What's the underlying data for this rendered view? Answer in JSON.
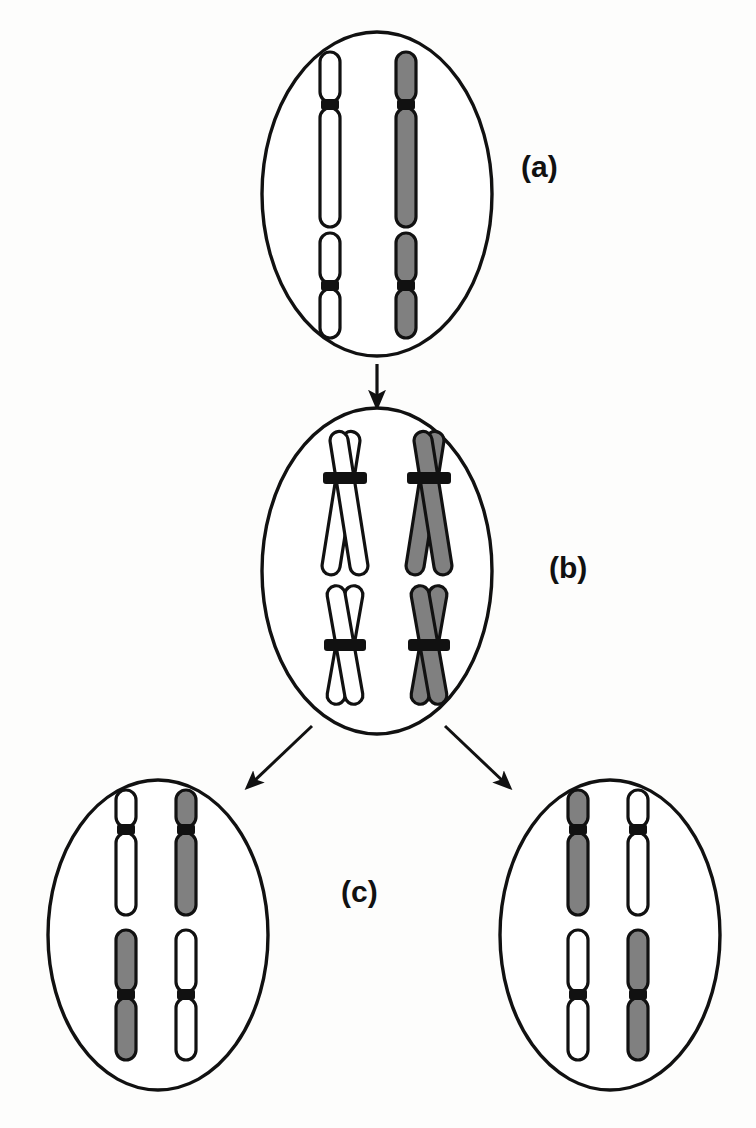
{
  "figure": {
    "background_color": "#fdfdfc",
    "stroke_color": "#111111",
    "chromosome_fill_white": "#ffffff",
    "chromosome_fill_gray": "#808080",
    "centromere_color": "#111111"
  },
  "labels": {
    "a": "(a)",
    "b": "(b)",
    "c": "(c)"
  },
  "cells": {
    "parent": {
      "name": "parent-cell",
      "label": "(a)",
      "cx": 377,
      "cy": 194,
      "rx": 115,
      "ry": 162,
      "state": "unreplicated",
      "chromosomes": [
        {
          "id": "a-long-white",
          "type": "acrocentric",
          "color": "white",
          "x": 330,
          "top": 52,
          "bottom": 227,
          "centromere_frac": 0.3
        },
        {
          "id": "a-long-gray",
          "type": "acrocentric",
          "color": "gray",
          "x": 406,
          "top": 52,
          "bottom": 227,
          "centromere_frac": 0.3
        },
        {
          "id": "a-short-white",
          "type": "metacentric",
          "color": "white",
          "x": 330,
          "top": 233,
          "bottom": 338,
          "centromere_frac": 0.5
        },
        {
          "id": "a-short-gray",
          "type": "metacentric",
          "color": "gray",
          "x": 406,
          "top": 233,
          "bottom": 338,
          "centromere_frac": 0.5
        }
      ]
    },
    "replicated": {
      "name": "replicated-cell",
      "label": "(b)",
      "cx": 377,
      "cy": 571,
      "rx": 115,
      "ry": 163,
      "state": "replicated-sister-chromatids",
      "chromosomes": [
        {
          "id": "b-long-white",
          "type": "acrocentric-x",
          "color": "white",
          "cx": 345,
          "cy": 478,
          "arm_up": 40,
          "arm_down": 92
        },
        {
          "id": "b-long-gray",
          "type": "acrocentric-x",
          "color": "gray",
          "cx": 429,
          "cy": 478,
          "arm_up": 40,
          "arm_down": 92
        },
        {
          "id": "b-short-white",
          "type": "metacentric-x",
          "color": "white",
          "cx": 345,
          "cy": 645,
          "arm_up": 57,
          "arm_down": 57
        },
        {
          "id": "b-short-gray",
          "type": "metacentric-x",
          "color": "gray",
          "cx": 429,
          "cy": 645,
          "arm_up": 57,
          "arm_down": 57
        }
      ]
    },
    "daughter_left": {
      "name": "daughter-cell-left",
      "label": "(c)",
      "cx": 158,
      "cy": 935,
      "rx": 110,
      "ry": 155,
      "state": "unreplicated",
      "chromosomes": [
        {
          "id": "cl-long-white",
          "type": "acrocentric",
          "color": "white",
          "x": 126,
          "top": 790,
          "bottom": 915,
          "centromere_frac": 0.3
        },
        {
          "id": "cl-long-gray",
          "type": "acrocentric",
          "color": "gray",
          "x": 186,
          "top": 790,
          "bottom": 915,
          "centromere_frac": 0.3
        },
        {
          "id": "cl-short-gray",
          "type": "metacentric",
          "color": "gray",
          "x": 126,
          "top": 930,
          "bottom": 1060,
          "centromere_frac": 0.5
        },
        {
          "id": "cl-short-white",
          "type": "metacentric",
          "color": "white",
          "x": 186,
          "top": 930,
          "bottom": 1060,
          "centromere_frac": 0.5
        }
      ]
    },
    "daughter_right": {
      "name": "daughter-cell-right",
      "label": "(c)",
      "cx": 610,
      "cy": 935,
      "rx": 110,
      "ry": 155,
      "state": "unreplicated",
      "chromosomes": [
        {
          "id": "cr-long-gray",
          "type": "acrocentric",
          "color": "gray",
          "x": 578,
          "top": 790,
          "bottom": 915,
          "centromere_frac": 0.3
        },
        {
          "id": "cr-long-white",
          "type": "acrocentric",
          "color": "white",
          "x": 638,
          "top": 790,
          "bottom": 915,
          "centromere_frac": 0.3
        },
        {
          "id": "cr-short-white",
          "type": "metacentric",
          "color": "white",
          "x": 578,
          "top": 930,
          "bottom": 1060,
          "centromere_frac": 0.5
        },
        {
          "id": "cr-short-gray",
          "type": "metacentric",
          "color": "gray",
          "x": 638,
          "top": 930,
          "bottom": 1060,
          "centromere_frac": 0.5
        }
      ]
    }
  },
  "arrows": [
    {
      "name": "arrow-parent-to-replicated",
      "direction": "down",
      "x1": 377,
      "y1": 364,
      "x2": 377,
      "y2": 402
    },
    {
      "name": "arrow-replicated-to-left-daughter",
      "direction": "down-left",
      "x1": 310,
      "y1": 727,
      "x2": 250,
      "y2": 785
    },
    {
      "name": "arrow-replicated-to-right-daughter",
      "direction": "down-right",
      "x1": 447,
      "y1": 727,
      "x2": 507,
      "y2": 785
    }
  ]
}
